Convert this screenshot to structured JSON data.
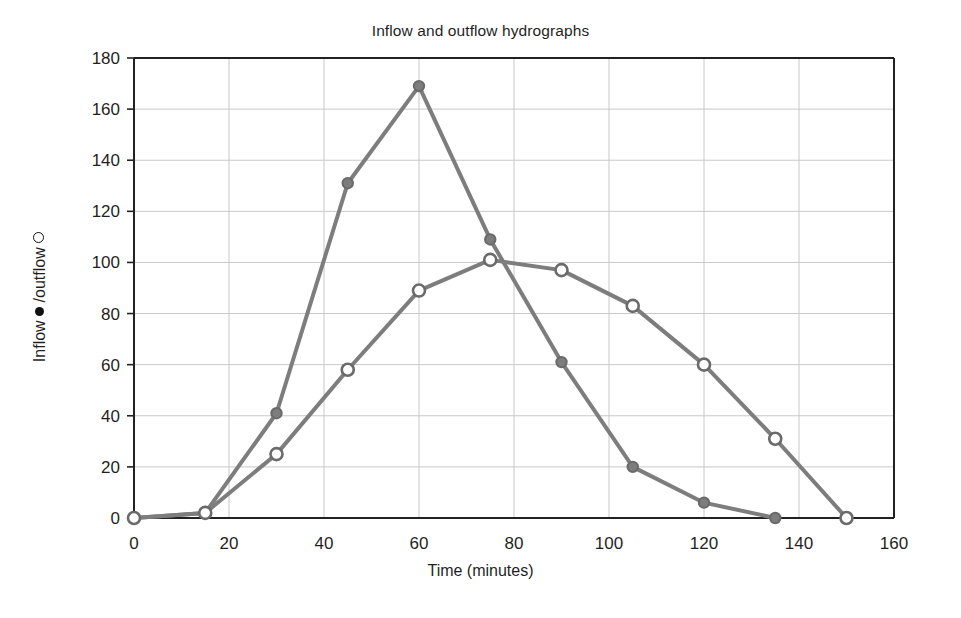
{
  "chart_data": {
    "type": "line",
    "title": "Inflow and outflow hydrographs",
    "xlabel": "Time (minutes)",
    "ylabel": "Inflow ● /outflow ○",
    "ylabel_parts": {
      "prefix": "Inflow ",
      "inflow_marker": "filled-circle",
      "middle": " /outflow ",
      "outflow_marker": "open-circle"
    },
    "xlim": [
      0,
      160
    ],
    "ylim": [
      0,
      180
    ],
    "xticks": [
      0,
      20,
      40,
      60,
      80,
      100,
      120,
      140,
      160
    ],
    "yticks": [
      0,
      20,
      40,
      60,
      80,
      100,
      120,
      140,
      160,
      180
    ],
    "xtick_labels": [
      "0",
      "20",
      "40",
      "60",
      "80",
      "100",
      "120",
      "140",
      "160"
    ],
    "ytick_labels": [
      "0",
      "20",
      "40",
      "60",
      "80",
      "100",
      "120",
      "140",
      "160",
      "180"
    ],
    "grid": true,
    "legend": "none",
    "line_color": "#7d7d7d",
    "axis_color": "#222222",
    "grid_color": "#c8c8c8",
    "series": [
      {
        "name": "Inflow",
        "marker": "filled-circle",
        "marker_fill": "#7d7d7d",
        "marker_edge": "#6a6a6a",
        "x": [
          0,
          15,
          30,
          45,
          60,
          75,
          90,
          105,
          120,
          135
        ],
        "values": [
          0,
          2,
          41,
          131,
          169,
          109,
          61,
          20,
          6,
          0
        ]
      },
      {
        "name": "Outflow",
        "marker": "open-circle",
        "marker_fill": "#ffffff",
        "marker_edge": "#6a6a6a",
        "x": [
          0,
          15,
          30,
          45,
          60,
          75,
          90,
          105,
          120,
          135,
          150
        ],
        "values": [
          0,
          2,
          25,
          58,
          89,
          101,
          97,
          83,
          60,
          31,
          0
        ]
      }
    ]
  }
}
